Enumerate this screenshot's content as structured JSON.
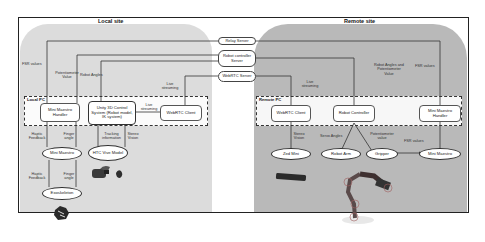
{
  "local_site": {
    "title": "Local site",
    "pc_label": "Local PC",
    "nodes": {
      "mini_maestro_handler": "Mini Maestro Handler",
      "unity": "Unity 3D Control System (Robot model, IK system)",
      "webrtc_client": "WebRTC Client"
    },
    "devices": {
      "mini_maestro": "Mini Maestro",
      "htc_vive": "HTC Vive Model",
      "exoskeleton": "Exoskeleton"
    },
    "labels": {
      "fsr_values": "FSR values",
      "potentiometer_value": "Potentiometer Value",
      "robot_angles": "Robot Angles",
      "live_streaming_top": "Live streaming",
      "live_streaming_mid": "Live streaming",
      "haptic_feedback_1": "Haptic Feedback",
      "finger_angle_1": "Finger angle",
      "tracking_information": "Tracking information",
      "stereo_vision": "Stereo Vision",
      "haptic_feedback_2": "Haptic Feedback",
      "finger_angle_2": "Finger angle"
    }
  },
  "servers": {
    "relay": "Relay Server",
    "robot_controller": "Robot controller Server",
    "webrtc": "WebRTC Server"
  },
  "remote_site": {
    "title": "Remote site",
    "pc_label": "Remote PC",
    "nodes": {
      "webrtc_client": "WebRTC Client",
      "robot_controller": "Robot Controller",
      "mini_maestro_handler": "Mini Maestro Handler"
    },
    "devices": {
      "zed_mini": "Zed Mini",
      "robot_arm": "Robot Arm",
      "gripper": "Gripper",
      "mini_maestro": "Mini Maestro"
    },
    "labels": {
      "live_streaming": "Live streaming",
      "robot_angles_pot": "Robot Angles and Potentiometer Value",
      "fsr_values_top": "FSR values",
      "stereo_vision": "Stereo Vision",
      "servo_angles": "Servo Angles",
      "potentiometer_value": "Potentiometer value",
      "fsr_values_bottom": "FSR values"
    }
  }
}
